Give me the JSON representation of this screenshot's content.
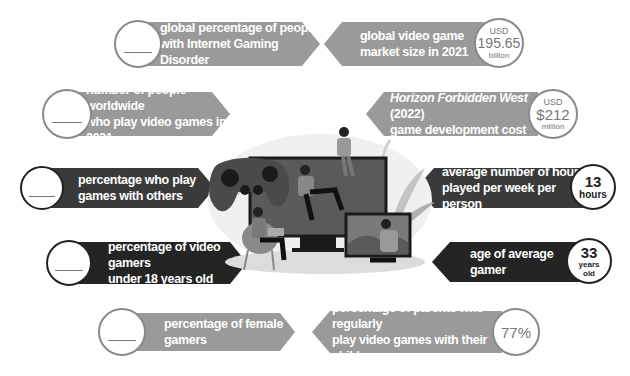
{
  "colors": {
    "light_banner": "#9a9a9a",
    "mid_banner": "#6e6e6e",
    "dark_banner": "#2a2a2a",
    "circle_border_light": "#8a8a8a"
  },
  "left_items": [
    {
      "label_line1": "global percentage of people",
      "label_line2": "with Internet Gaming Disorder",
      "value": "",
      "style": "light"
    },
    {
      "label_line1": "number of people worldwide",
      "label_line2": "who play video games in 2021",
      "value": "",
      "style": "light"
    },
    {
      "label_line1": "percentage who play",
      "label_line2": "games with others",
      "value": "",
      "style": "dark"
    },
    {
      "label_line1": "percentage of video gamers",
      "label_line2": "under 18 years old",
      "value": "",
      "style": "dark"
    },
    {
      "label_line1": "percentage of female gamers",
      "label_line2": "",
      "value": "",
      "style": "light"
    }
  ],
  "right_items": [
    {
      "label_line1": "global video game",
      "label_line2": "market size in 2021",
      "unit_top": "USD",
      "value": "195.65",
      "unit_bottom": "billion",
      "style": "light"
    },
    {
      "label_line1_italic": "Horizon Forbidden West",
      "label_line1_rest": " (2022)",
      "label_line2": "game development cost",
      "unit_top": "USD",
      "value": "$212",
      "unit_bottom": "million",
      "style": "light"
    },
    {
      "label_line1": "average number of hours",
      "label_line2": "played per week per person",
      "value": "13",
      "unit_bottom": "hours",
      "style": "dark"
    },
    {
      "label_line1": "age of average gamer",
      "label_line2": "",
      "value": "33",
      "unit_bottom_1": "years",
      "unit_bottom_2": "old",
      "style": "dark"
    },
    {
      "label_line1": "percentage of parents who regularly",
      "label_line2": "play video games with their children",
      "value": "77%",
      "style": "light"
    }
  ],
  "illustration": {
    "description": "people gaming around a large monitor with controller and tablet"
  }
}
